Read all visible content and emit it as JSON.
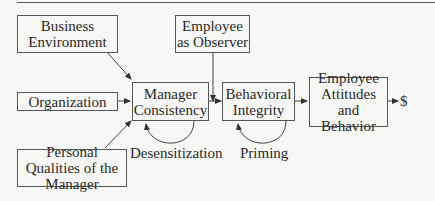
{
  "diagram": {
    "nodes": {
      "business_environment": "Business Environment",
      "organization": "Organization",
      "personal_qualities": "Personal Qualities of the Manager",
      "employee_observer": "Employee as Observer",
      "manager_consistency": "Manager Consistency",
      "behavioral_integrity": "Behavioral Integrity",
      "employee_attitudes": "Employee Attitudes and Behavior"
    },
    "loop_labels": {
      "desensitization": "Desensitization",
      "priming": "Priming"
    },
    "outcome": "$",
    "colors": {
      "line": "#555555",
      "background": "#f7f7f5",
      "text": "#2a2a2a"
    }
  }
}
